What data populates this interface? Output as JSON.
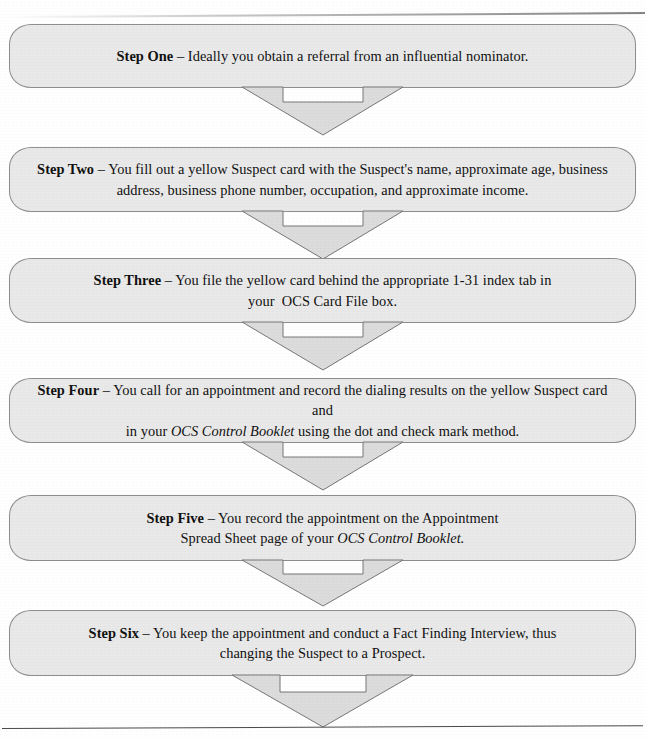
{
  "diagram": {
    "colors": {
      "box_fill": "#e9e9e9",
      "box_border": "#8e8e8e",
      "arrow_fill": "#dcdcdc",
      "arrow_border": "#767676",
      "page_background": "#ffffff",
      "text": "#111111"
    },
    "steps": [
      {
        "id": "step-one",
        "label": "Step One",
        "dash": " – ",
        "lines": [
          "Ideally you obtain a referral from an influential nominator."
        ]
      },
      {
        "id": "step-two",
        "label": "Step Two",
        "dash": " – ",
        "lines": [
          "You fill out a yellow Suspect card with the Suspect's name, approximate age, business",
          "address, business phone number, occupation, and approximate income."
        ]
      },
      {
        "id": "step-three",
        "label": "Step Three",
        "dash": " – ",
        "lines": [
          "You file the yellow card behind the appropriate 1-31 index tab in",
          "your  OCS Card File box."
        ]
      },
      {
        "id": "step-four",
        "label": "Step Four",
        "dash": " – ",
        "lines_rich": [
          [
            {
              "text": "You call for an appointment and record the dialing results on the yellow Suspect card and",
              "style": "normal"
            }
          ],
          [
            {
              "text": "in your ",
              "style": "normal"
            },
            {
              "text": "OCS Control Booklet",
              "style": "italic"
            },
            {
              "text": " using the dot and check mark method.",
              "style": "normal"
            }
          ]
        ]
      },
      {
        "id": "step-five",
        "label": "Step Five",
        "dash": " – ",
        "lines_rich": [
          [
            {
              "text": "You record the appointment on the Appointment",
              "style": "normal"
            }
          ],
          [
            {
              "text": "Spread Sheet page of your ",
              "style": "normal"
            },
            {
              "text": "OCS Control Booklet.",
              "style": "italic"
            }
          ]
        ]
      },
      {
        "id": "step-six",
        "label": "Step Six",
        "dash": " – ",
        "lines": [
          "You keep the appointment and conduct a Fact Finding Interview, thus",
          "changing the Suspect to a Prospect."
        ]
      }
    ],
    "connectors": [
      {
        "id": "arrow-one-to-two",
        "from": "step-one",
        "to": "step-two",
        "direction": "down"
      },
      {
        "id": "arrow-two-to-three",
        "from": "step-two",
        "to": "step-three",
        "direction": "down"
      },
      {
        "id": "arrow-three-to-four",
        "from": "step-three",
        "to": "step-four",
        "direction": "down"
      },
      {
        "id": "arrow-four-to-five",
        "from": "step-four",
        "to": "step-five",
        "direction": "down"
      },
      {
        "id": "arrow-five-to-six",
        "from": "step-five",
        "to": "step-six",
        "direction": "down"
      },
      {
        "id": "arrow-six-to-end",
        "from": "step-six",
        "to": "page-end",
        "direction": "down"
      }
    ]
  }
}
